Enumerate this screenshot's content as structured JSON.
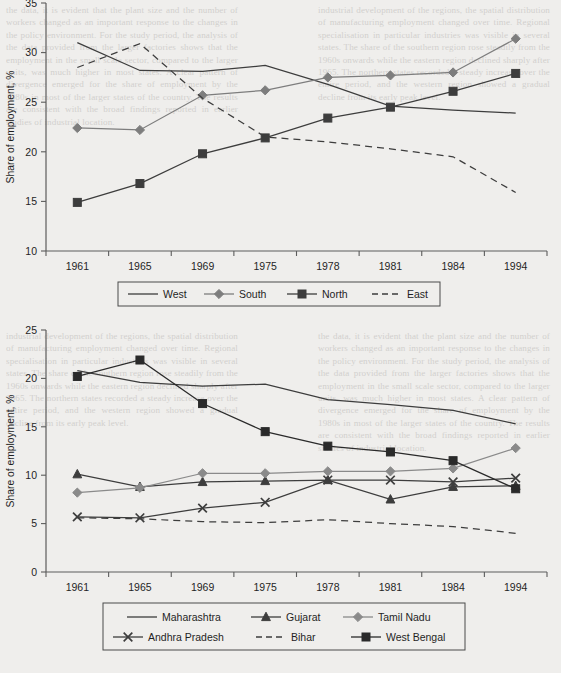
{
  "page": {
    "background_color": "#efeeec",
    "bleed_text_left": "the data, it is evident that the plant size and the number of workers changed as an important response to the changes in the policy environment. For the study period, the analysis of the data provided from the larger factories shows that the employment in the small scale sector, compared to the larger units, was much higher in most states. A clear pattern of divergence emerged for the share of employment by the 1980s in most of the larger states of the country. The results are consistent with the broad findings reported in earlier studies of industrial location.",
    "bleed_text_right": "industrial development of the regions, the spatial distribution of manufacturing employment changed over time. Regional specialisation in particular industries was visible in several states. The share of the southern region rose steadily from the 1960s onwards while the eastern region declined sharply after 1965. The northern states recorded a steady increase over the entire period, and the western region showed a gradual decline from its early peak level."
  },
  "chart_data": [
    {
      "id": "regional-shares",
      "type": "line",
      "title": "",
      "xlabel": "",
      "ylabel": "Share of employment, %",
      "categories": [
        "1961",
        "1965",
        "1969",
        "1975",
        "1978",
        "1981",
        "1984",
        "1994"
      ],
      "ylim": [
        10,
        35
      ],
      "yticks": [
        10,
        15,
        20,
        25,
        30,
        35
      ],
      "ytick_labels": [
        "10",
        "15",
        "20",
        "25",
        "30",
        "35"
      ],
      "grid": false,
      "legend_position": "bottom",
      "series": [
        {
          "name": "West",
          "marker": "none",
          "dash": "solid",
          "color": "#3d3d3d",
          "values": [
            31.0,
            28.2,
            28.1,
            28.7,
            26.8,
            24.6,
            24.2,
            23.9
          ]
        },
        {
          "name": "South",
          "marker": "diamond",
          "dash": "solid",
          "color": "#7d7d7d",
          "values": [
            22.4,
            22.2,
            25.7,
            26.2,
            27.5,
            27.7,
            28.0,
            31.4
          ]
        },
        {
          "name": "North",
          "marker": "square",
          "dash": "solid",
          "color": "#3d3d3d",
          "values": [
            14.9,
            16.8,
            19.8,
            21.4,
            23.4,
            24.5,
            26.1,
            27.9
          ]
        },
        {
          "name": "East",
          "marker": "none",
          "dash": "dashed",
          "color": "#3d3d3d",
          "values": [
            28.5,
            30.9,
            25.4,
            21.5,
            21.0,
            20.3,
            19.5,
            15.9
          ]
        }
      ]
    },
    {
      "id": "state-shares",
      "type": "line",
      "title": "",
      "xlabel": "",
      "ylabel": "Share of employment, %",
      "categories": [
        "1961",
        "1965",
        "1969",
        "1975",
        "1978",
        "1981",
        "1984",
        "1994"
      ],
      "ylim": [
        0,
        25
      ],
      "yticks": [
        0,
        5,
        10,
        15,
        20,
        25
      ],
      "ytick_labels": [
        "0",
        "5",
        "10",
        "15",
        "20",
        "25"
      ],
      "grid": false,
      "legend_position": "bottom",
      "series": [
        {
          "name": "Maharashtra",
          "marker": "none",
          "dash": "solid",
          "color": "#3d3d3d",
          "values": [
            20.8,
            19.6,
            19.2,
            19.4,
            17.8,
            17.3,
            16.7,
            15.3
          ]
        },
        {
          "name": "Gujarat",
          "marker": "triangle",
          "dash": "solid",
          "color": "#3d3d3d",
          "values": [
            10.1,
            8.8,
            9.3,
            9.4,
            9.5,
            7.5,
            8.8,
            8.9
          ]
        },
        {
          "name": "Tamil Nadu",
          "marker": "diamond",
          "dash": "solid",
          "color": "#8a8a8a",
          "values": [
            8.2,
            8.7,
            10.2,
            10.2,
            10.4,
            10.4,
            10.7,
            12.8
          ]
        },
        {
          "name": "Andhra Pradesh",
          "marker": "cross",
          "dash": "solid",
          "color": "#3d3d3d",
          "values": [
            5.7,
            5.6,
            6.6,
            7.2,
            9.5,
            9.5,
            9.3,
            9.7
          ]
        },
        {
          "name": "Bihar",
          "marker": "none",
          "dash": "dashed",
          "color": "#3d3d3d",
          "values": [
            5.6,
            5.5,
            5.2,
            5.1,
            5.4,
            5.0,
            4.7,
            4.0
          ]
        },
        {
          "name": "West Bengal",
          "marker": "square",
          "dash": "solid",
          "color": "#2a2a2a",
          "values": [
            20.2,
            21.9,
            17.4,
            14.5,
            13.0,
            12.4,
            11.5,
            8.6
          ]
        }
      ]
    }
  ]
}
